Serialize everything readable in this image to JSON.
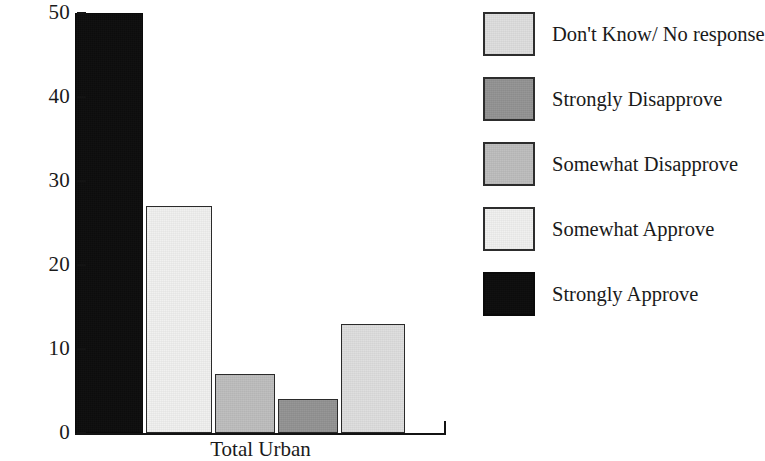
{
  "chart_data": {
    "type": "bar",
    "title": "",
    "subtitle": "",
    "xlabel": "",
    "ylabel": "",
    "categories": [
      "Total Urban"
    ],
    "ylim": [
      0,
      50
    ],
    "y_ticks": [
      0,
      10,
      20,
      30,
      40,
      50
    ],
    "y_tick_labels": [
      "0",
      "10",
      "20",
      "30",
      "40",
      "50"
    ],
    "grid": false,
    "legend_position": "right",
    "series": [
      {
        "name": "Strongly Approve",
        "values": [
          50
        ],
        "color": "#0d0d0d"
      },
      {
        "name": "Somewhat Approve",
        "values": [
          27
        ],
        "color": "#f0f0ef"
      },
      {
        "name": "Somewhat Disapprove",
        "values": [
          7
        ],
        "color": "#bdbdbd"
      },
      {
        "name": "Strongly Disapprove",
        "values": [
          4
        ],
        "color": "#939393"
      },
      {
        "name": "Don't Know/ No response",
        "values": [
          13
        ],
        "color": "#dedede"
      }
    ],
    "bars": [
      {
        "label": "Strongly Approve",
        "value": 50,
        "color": "#0d0d0d",
        "left": 75,
        "width": 68
      },
      {
        "label": "Somewhat Approve",
        "value": 27,
        "color": "#f0f0ef",
        "left": 146,
        "width": 66
      },
      {
        "label": "Somewhat Disapprove",
        "value": 7,
        "color": "#bdbdbd",
        "left": 215,
        "width": 60
      },
      {
        "label": "Strongly Disapprove",
        "value": 4,
        "color": "#939393",
        "left": 278,
        "width": 60
      },
      {
        "label": "Don't Know/ No response",
        "value": 13,
        "color": "#dedede",
        "left": 341,
        "width": 64
      }
    ]
  },
  "axis": {
    "x_category_label": "Total Urban"
  },
  "legend": {
    "entries": [
      {
        "label": "Don't Know/ No response",
        "color": "#dedede"
      },
      {
        "label": "Strongly Disapprove",
        "color": "#939393"
      },
      {
        "label": "Somewhat Disapprove",
        "color": "#bdbdbd"
      },
      {
        "label": "Somewhat Approve",
        "color": "#f0f0ef"
      },
      {
        "label": "Strongly Approve",
        "color": "#0d0d0d"
      }
    ]
  }
}
